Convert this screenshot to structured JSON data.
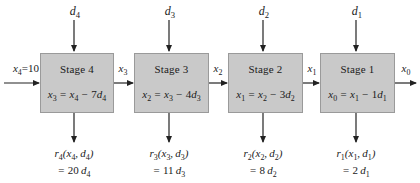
{
  "diagram": {
    "input": {
      "label": "x",
      "sub": "4",
      "value": "=10",
      "full": "x4 =10"
    },
    "output": {
      "label": "x",
      "sub": "0",
      "full": "x0"
    },
    "box_fill": "#c9c9c9",
    "box_border": "#9a9a9a",
    "arrow_color": "#222222",
    "stages": [
      {
        "name": "Stage 4",
        "decision": {
          "label": "d",
          "sub": "4"
        },
        "state_out": {
          "label": "x",
          "sub": "3"
        },
        "equation": {
          "lhs_var": "x",
          "lhs_sub": "3",
          "rhs": "= x4 − 7d4",
          "rhs_var1": "x",
          "rhs_sub1": "4",
          "coef": "7",
          "rhs_var2": "d",
          "rhs_sub2": "4"
        },
        "return": {
          "fn": "r",
          "fn_sub": "4",
          "args": "(x4, d4)",
          "value": "= 20 d4",
          "coef": "20",
          "arg_var": "d",
          "arg_sub": "4"
        }
      },
      {
        "name": "Stage 3",
        "decision": {
          "label": "d",
          "sub": "3"
        },
        "state_out": {
          "label": "x",
          "sub": "2"
        },
        "equation": {
          "lhs_var": "x",
          "lhs_sub": "2",
          "rhs": "= x3 − 4d3",
          "rhs_var1": "x",
          "rhs_sub1": "3",
          "coef": "4",
          "rhs_var2": "d",
          "rhs_sub2": "3"
        },
        "return": {
          "fn": "r",
          "fn_sub": "3",
          "args": "(x3, d3)",
          "value": "= 11 d3",
          "coef": "11",
          "arg_var": "d",
          "arg_sub": "3"
        }
      },
      {
        "name": "Stage 2",
        "decision": {
          "label": "d",
          "sub": "2"
        },
        "state_out": {
          "label": "x",
          "sub": "1"
        },
        "equation": {
          "lhs_var": "x",
          "lhs_sub": "1",
          "rhs": "= x2 − 3d2",
          "rhs_var1": "x",
          "rhs_sub1": "2",
          "coef": "3",
          "rhs_var2": "d",
          "rhs_sub2": "2"
        },
        "return": {
          "fn": "r",
          "fn_sub": "2",
          "args": "(x2, d2)",
          "value": "= 8 d2",
          "coef": "8",
          "arg_var": "d",
          "arg_sub": "2"
        }
      },
      {
        "name": "Stage 1",
        "decision": {
          "label": "d",
          "sub": "1"
        },
        "state_out": {
          "label": "x",
          "sub": "0"
        },
        "equation": {
          "lhs_var": "x",
          "lhs_sub": "0",
          "rhs": "= x1 − 1d1",
          "rhs_var1": "x",
          "rhs_sub1": "1",
          "coef": "1",
          "rhs_var2": "d",
          "rhs_sub2": "1"
        },
        "return": {
          "fn": "r",
          "fn_sub": "1",
          "args": "(x1, d1)",
          "value": "= 2 d1",
          "coef": "2",
          "arg_var": "d",
          "arg_sub": "1"
        }
      }
    ]
  }
}
